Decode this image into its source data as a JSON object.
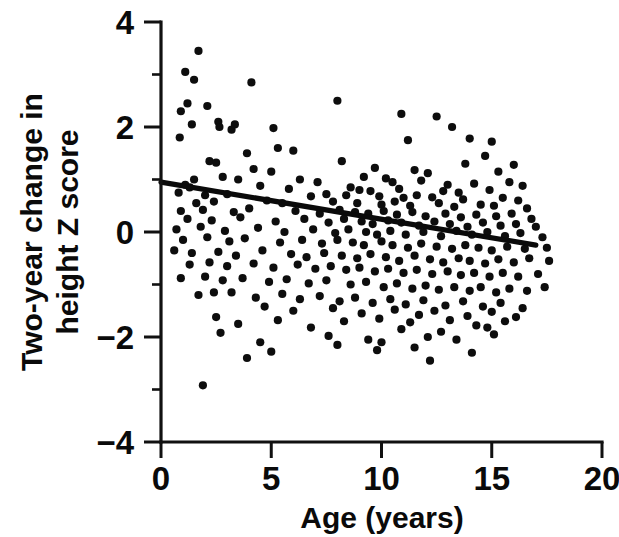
{
  "chart_data": {
    "type": "scatter",
    "title": "",
    "xlabel": "Age (years)",
    "ylabel": "Two-year change in height Z score",
    "ylabel_line1": "Two-year change in",
    "ylabel_line2": "height Z score",
    "xlim": [
      0,
      20
    ],
    "ylim": [
      -4,
      4
    ],
    "xticks": [
      0,
      5,
      10,
      15,
      20
    ],
    "xticklabels": [
      "0",
      "5",
      "10",
      "15",
      "20"
    ],
    "yticks": [
      -4,
      -2,
      0,
      2,
      4
    ],
    "yticklabels": [
      "−4",
      "−2",
      "0",
      "2",
      "4"
    ],
    "x_minor_ticks": [],
    "y_minor_ticks": [
      -3,
      -1,
      1,
      3
    ],
    "grid": false,
    "legend": null,
    "marker_color": "#0d0d0d",
    "marker_size_px": 5.0,
    "axis_color": "#111111",
    "background_color": "#ffffff",
    "trendline": {
      "name": "linear regression fit",
      "color": "#0a0a0a",
      "x_start": 0.0,
      "y_start": 0.95,
      "x_end": 17.0,
      "y_end": -0.25,
      "slope": -0.0706,
      "intercept": 0.95
    },
    "n_points": 293,
    "points": [
      [
        1.7,
        3.45
      ],
      [
        1.1,
        3.05
      ],
      [
        1.5,
        2.9
      ],
      [
        4.1,
        2.85
      ],
      [
        1.2,
        2.45
      ],
      [
        2.1,
        2.4
      ],
      [
        8.0,
        2.5
      ],
      [
        0.9,
        2.3
      ],
      [
        10.9,
        2.25
      ],
      [
        12.5,
        2.2
      ],
      [
        1.4,
        2.05
      ],
      [
        2.6,
        2.1
      ],
      [
        2.65,
        2.0
      ],
      [
        3.2,
        1.95
      ],
      [
        3.35,
        2.05
      ],
      [
        5.1,
        1.98
      ],
      [
        13.2,
        2.0
      ],
      [
        0.85,
        1.8
      ],
      [
        11.2,
        1.75
      ],
      [
        14.0,
        1.78
      ],
      [
        15.0,
        1.72
      ],
      [
        5.3,
        1.6
      ],
      [
        6.0,
        1.55
      ],
      [
        14.7,
        1.45
      ],
      [
        3.9,
        1.5
      ],
      [
        2.2,
        1.35
      ],
      [
        2.5,
        1.32
      ],
      [
        8.2,
        1.35
      ],
      [
        13.8,
        1.3
      ],
      [
        16.0,
        1.28
      ],
      [
        4.2,
        1.2
      ],
      [
        5.0,
        1.15
      ],
      [
        9.7,
        1.22
      ],
      [
        11.5,
        1.18
      ],
      [
        12.1,
        1.12
      ],
      [
        15.3,
        1.15
      ],
      [
        1.5,
        1.0
      ],
      [
        2.8,
        1.05
      ],
      [
        3.5,
        1.0
      ],
      [
        6.3,
        1.0
      ],
      [
        7.1,
        0.95
      ],
      [
        9.2,
        1.05
      ],
      [
        10.2,
        1.02
      ],
      [
        10.5,
        0.95
      ],
      [
        11.8,
        0.98
      ],
      [
        13.0,
        0.9
      ],
      [
        14.2,
        0.92
      ],
      [
        15.8,
        0.95
      ],
      [
        16.4,
        0.88
      ],
      [
        1.1,
        0.9
      ],
      [
        1.3,
        0.85
      ],
      [
        4.5,
        0.88
      ],
      [
        5.8,
        0.82
      ],
      [
        8.6,
        0.85
      ],
      [
        9.0,
        0.8
      ],
      [
        9.5,
        0.78
      ],
      [
        10.8,
        0.82
      ],
      [
        12.8,
        0.78
      ],
      [
        13.5,
        0.75
      ],
      [
        14.9,
        0.8
      ],
      [
        0.8,
        0.75
      ],
      [
        2.0,
        0.7
      ],
      [
        3.0,
        0.72
      ],
      [
        6.8,
        0.68
      ],
      [
        7.5,
        0.72
      ],
      [
        8.4,
        0.7
      ],
      [
        9.9,
        0.68
      ],
      [
        11.0,
        0.65
      ],
      [
        11.6,
        0.7
      ],
      [
        12.3,
        0.66
      ],
      [
        13.7,
        0.62
      ],
      [
        15.5,
        0.65
      ],
      [
        16.2,
        0.6
      ],
      [
        1.6,
        0.55
      ],
      [
        2.4,
        0.58
      ],
      [
        4.8,
        0.6
      ],
      [
        5.5,
        0.55
      ],
      [
        7.8,
        0.58
      ],
      [
        8.9,
        0.55
      ],
      [
        10.0,
        0.52
      ],
      [
        10.6,
        0.58
      ],
      [
        11.3,
        0.5
      ],
      [
        12.6,
        0.55
      ],
      [
        13.3,
        0.48
      ],
      [
        14.5,
        0.52
      ],
      [
        15.1,
        0.5
      ],
      [
        16.6,
        0.45
      ],
      [
        0.9,
        0.4
      ],
      [
        1.9,
        0.42
      ],
      [
        3.3,
        0.38
      ],
      [
        4.0,
        0.45
      ],
      [
        6.1,
        0.4
      ],
      [
        7.2,
        0.35
      ],
      [
        8.1,
        0.42
      ],
      [
        8.8,
        0.38
      ],
      [
        9.4,
        0.35
      ],
      [
        10.1,
        0.4
      ],
      [
        10.7,
        0.33
      ],
      [
        11.4,
        0.38
      ],
      [
        12.0,
        0.3
      ],
      [
        12.9,
        0.35
      ],
      [
        13.6,
        0.28
      ],
      [
        14.3,
        0.33
      ],
      [
        15.2,
        0.3
      ],
      [
        15.9,
        0.35
      ],
      [
        16.8,
        0.25
      ],
      [
        1.2,
        0.25
      ],
      [
        2.3,
        0.22
      ],
      [
        3.6,
        0.28
      ],
      [
        5.2,
        0.2
      ],
      [
        6.5,
        0.25
      ],
      [
        7.6,
        0.18
      ],
      [
        8.3,
        0.25
      ],
      [
        9.1,
        0.2
      ],
      [
        9.6,
        0.15
      ],
      [
        10.3,
        0.22
      ],
      [
        10.9,
        0.18
      ],
      [
        11.7,
        0.12
      ],
      [
        12.4,
        0.2
      ],
      [
        13.1,
        0.15
      ],
      [
        13.9,
        0.1
      ],
      [
        14.6,
        0.18
      ],
      [
        15.4,
        0.12
      ],
      [
        16.1,
        0.15
      ],
      [
        17.0,
        0.1
      ],
      [
        0.7,
        0.05
      ],
      [
        1.8,
        0.1
      ],
      [
        2.9,
        0.02
      ],
      [
        4.4,
        0.08
      ],
      [
        5.6,
        0.0
      ],
      [
        6.9,
        0.05
      ],
      [
        7.9,
        -0.02
      ],
      [
        8.5,
        0.05
      ],
      [
        9.3,
        0.0
      ],
      [
        9.8,
        -0.05
      ],
      [
        10.4,
        0.02
      ],
      [
        11.1,
        -0.05
      ],
      [
        11.9,
        0.0
      ],
      [
        12.7,
        -0.08
      ],
      [
        13.4,
        0.02
      ],
      [
        14.1,
        -0.05
      ],
      [
        14.8,
        0.0
      ],
      [
        15.6,
        -0.08
      ],
      [
        16.3,
        -0.02
      ],
      [
        17.3,
        -0.1
      ],
      [
        1.0,
        -0.15
      ],
      [
        2.1,
        -0.1
      ],
      [
        3.1,
        -0.18
      ],
      [
        3.8,
        -0.12
      ],
      [
        5.4,
        -0.2
      ],
      [
        6.4,
        -0.15
      ],
      [
        7.3,
        -0.22
      ],
      [
        8.0,
        -0.15
      ],
      [
        8.7,
        -0.2
      ],
      [
        9.2,
        -0.25
      ],
      [
        10.0,
        -0.18
      ],
      [
        10.5,
        -0.25
      ],
      [
        11.2,
        -0.3
      ],
      [
        11.8,
        -0.22
      ],
      [
        12.5,
        -0.28
      ],
      [
        13.2,
        -0.32
      ],
      [
        13.8,
        -0.25
      ],
      [
        14.4,
        -0.3
      ],
      [
        15.0,
        -0.35
      ],
      [
        15.7,
        -0.28
      ],
      [
        16.5,
        -0.32
      ],
      [
        17.5,
        -0.3
      ],
      [
        0.6,
        -0.35
      ],
      [
        1.4,
        -0.4
      ],
      [
        2.6,
        -0.38
      ],
      [
        3.4,
        -0.45
      ],
      [
        4.6,
        -0.35
      ],
      [
        5.9,
        -0.42
      ],
      [
        6.6,
        -0.48
      ],
      [
        7.4,
        -0.4
      ],
      [
        8.2,
        -0.45
      ],
      [
        8.9,
        -0.5
      ],
      [
        9.5,
        -0.42
      ],
      [
        10.2,
        -0.48
      ],
      [
        10.8,
        -0.55
      ],
      [
        11.5,
        -0.45
      ],
      [
        12.2,
        -0.52
      ],
      [
        12.8,
        -0.58
      ],
      [
        13.5,
        -0.5
      ],
      [
        14.0,
        -0.55
      ],
      [
        14.7,
        -0.6
      ],
      [
        15.3,
        -0.52
      ],
      [
        16.0,
        -0.58
      ],
      [
        16.7,
        -0.5
      ],
      [
        17.6,
        -0.55
      ],
      [
        1.3,
        -0.62
      ],
      [
        2.2,
        -0.58
      ],
      [
        3.0,
        -0.65
      ],
      [
        4.2,
        -0.6
      ],
      [
        5.1,
        -0.68
      ],
      [
        6.2,
        -0.62
      ],
      [
        7.0,
        -0.7
      ],
      [
        7.7,
        -0.65
      ],
      [
        8.4,
        -0.72
      ],
      [
        9.0,
        -0.68
      ],
      [
        9.7,
        -0.75
      ],
      [
        10.3,
        -0.7
      ],
      [
        11.0,
        -0.78
      ],
      [
        11.6,
        -0.72
      ],
      [
        12.3,
        -0.8
      ],
      [
        13.0,
        -0.75
      ],
      [
        13.6,
        -0.82
      ],
      [
        14.2,
        -0.78
      ],
      [
        14.9,
        -0.85
      ],
      [
        15.5,
        -0.78
      ],
      [
        16.2,
        -0.85
      ],
      [
        17.1,
        -0.8
      ],
      [
        0.9,
        -0.88
      ],
      [
        2.0,
        -0.85
      ],
      [
        2.8,
        -0.92
      ],
      [
        3.7,
        -0.88
      ],
      [
        4.9,
        -0.95
      ],
      [
        5.7,
        -0.9
      ],
      [
        6.7,
        -0.98
      ],
      [
        7.5,
        -0.92
      ],
      [
        8.6,
        -1.0
      ],
      [
        9.3,
        -0.95
      ],
      [
        10.1,
        -1.05
      ],
      [
        10.7,
        -0.98
      ],
      [
        11.4,
        -1.08
      ],
      [
        12.0,
        -1.02
      ],
      [
        12.6,
        -1.1
      ],
      [
        13.3,
        -1.05
      ],
      [
        14.0,
        -1.12
      ],
      [
        14.5,
        -1.05
      ],
      [
        15.2,
        -1.15
      ],
      [
        15.8,
        -1.08
      ],
      [
        16.6,
        -1.12
      ],
      [
        17.4,
        -1.05
      ],
      [
        1.7,
        -1.2
      ],
      [
        3.2,
        -1.15
      ],
      [
        4.3,
        -1.25
      ],
      [
        5.5,
        -1.18
      ],
      [
        6.3,
        -1.28
      ],
      [
        7.2,
        -1.22
      ],
      [
        8.1,
        -1.32
      ],
      [
        8.8,
        -1.25
      ],
      [
        9.6,
        -1.35
      ],
      [
        10.4,
        -1.28
      ],
      [
        11.1,
        -1.38
      ],
      [
        11.9,
        -1.3
      ],
      [
        12.9,
        -1.4
      ],
      [
        13.7,
        -1.32
      ],
      [
        14.6,
        -1.42
      ],
      [
        15.4,
        -1.35
      ],
      [
        16.4,
        -1.45
      ],
      [
        2.4,
        -1.15
      ],
      [
        4.7,
        -1.42
      ],
      [
        6.0,
        -1.5
      ],
      [
        7.8,
        -1.45
      ],
      [
        9.1,
        -1.55
      ],
      [
        10.6,
        -1.48
      ],
      [
        11.7,
        -1.58
      ],
      [
        12.4,
        -1.5
      ],
      [
        13.9,
        -1.6
      ],
      [
        15.0,
        -1.52
      ],
      [
        16.1,
        -1.62
      ],
      [
        2.5,
        -1.62
      ],
      [
        5.3,
        -1.68
      ],
      [
        8.3,
        -1.7
      ],
      [
        9.9,
        -1.65
      ],
      [
        11.3,
        -1.72
      ],
      [
        13.1,
        -1.68
      ],
      [
        14.3,
        -1.78
      ],
      [
        15.6,
        -1.7
      ],
      [
        3.5,
        -1.75
      ],
      [
        6.8,
        -1.82
      ],
      [
        10.9,
        -1.85
      ],
      [
        12.7,
        -1.9
      ],
      [
        14.8,
        -1.82
      ],
      [
        2.7,
        -1.92
      ],
      [
        7.6,
        -1.98
      ],
      [
        9.4,
        -2.05
      ],
      [
        12.1,
        -2.0
      ],
      [
        15.1,
        -1.95
      ],
      [
        4.5,
        -2.1
      ],
      [
        8.0,
        -2.15
      ],
      [
        10.0,
        -2.1
      ],
      [
        13.4,
        -2.05
      ],
      [
        5.0,
        -2.28
      ],
      [
        9.8,
        -2.25
      ],
      [
        11.5,
        -2.2
      ],
      [
        14.1,
        -2.3
      ],
      [
        3.9,
        -2.4
      ],
      [
        12.2,
        -2.45
      ],
      [
        1.9,
        -2.92
      ]
    ]
  }
}
